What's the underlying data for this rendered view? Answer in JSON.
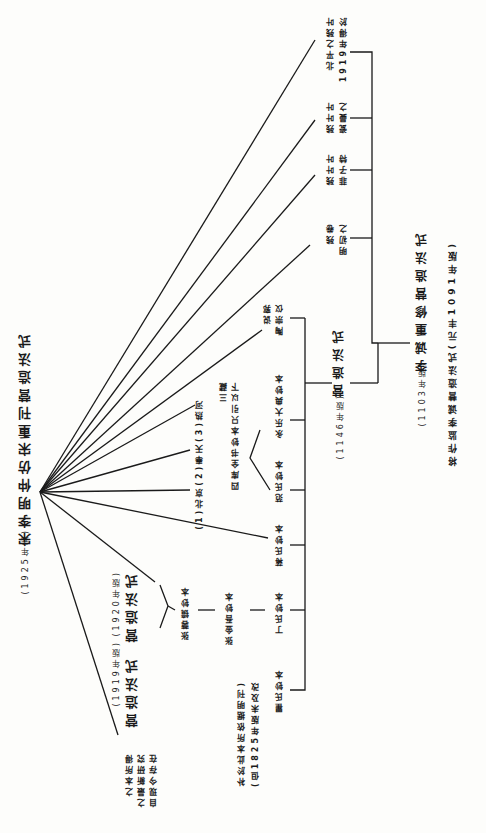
{
  "diagram": {
    "orientation": "rotated 90deg clockwise, text reads top-to-bottom in columns",
    "root": {
      "title": "宋李明仲营造法式",
      "sub": "(1001年)",
      "label_full": "将作监李诚营造法式(元丰1091年版)"
    },
    "nodes": {
      "n1103": {
        "title": "李诚重修营造法式",
        "year": "(1103年版)"
      },
      "n1146": {
        "title": "营造法式",
        "year": "(1146年版)"
      },
      "n1919_beiping": {
        "line1": "1919年得於",
        "line2": "北平之残叶"
      },
      "n_lou": {
        "line1": "瓷曼之",
        "line2": "残叶叶"
      },
      "n_fei": {
        "line1": "菲子特",
        "line2": "残叶叶"
      },
      "n_yi": {
        "line1": "明初之",
        "line2": "残卷"
      },
      "n_tao": {
        "line1": "陶宗仪",
        "line2": "说郛"
      },
      "n_yongle": {
        "title": "永乐大典钞本"
      },
      "n_fan": {
        "title": "范氏钞本"
      },
      "n_sikuquan": {
        "line1": "四库全书钞本只引以下",
        "line2": "三藏"
      },
      "n_three": {
        "text": "(1)北京(2)奉天(3)热河"
      },
      "n_jiang": {
        "title": "蒋氏钞本"
      },
      "n_ding": {
        "title": "丁氏钞本"
      },
      "n_qu": {
        "title": "瞿氏钞本"
      },
      "n_qu_note": {
        "line1": "(但1825年版未及改",
        "line2": "补於此本所依据明刊)"
      },
      "n_tian": {
        "title": "张金吾钞本"
      },
      "n_zhang": {
        "title": "张蓉镜钞本"
      },
      "n_1920": {
        "title": "营造法式",
        "year": "(1920年版)"
      },
      "n_1919": {
        "title": "营造法式",
        "year": "(1919年版)"
      },
      "n_self": {
        "line1": "自现今存在",
        "line2": "之最新研究",
        "line3": "之本所得"
      },
      "final": {
        "title": "宋李明仲营造法式重刊",
        "year": "(1925年元)"
      }
    },
    "final_title_full": "宋李明仲仿宋重刊营造法式",
    "final_year": "(1925年元)"
  },
  "labels": {
    "top_right_1": "将作监李诚营造法式(元丰1091年版)",
    "top_right_2": "李诚重修营造法式",
    "top_right_2_year": "(1103年版)",
    "center_title": "营造法式",
    "center_year": "(1146年版)",
    "leaf_1a": "1919年得於",
    "leaf_1b": "北平之残叶",
    "leaf_2a": "瓷曼之",
    "leaf_2b": "残叶叶",
    "leaf_3a": "菲子特",
    "leaf_3b": "残叶叶",
    "leaf_4a": "明初之",
    "leaf_4b": "残卷",
    "tao_a": "陶宗仪",
    "tao_b": "说郛",
    "yongle": "永乐大典钞本",
    "fan": "范氏钞本",
    "siku_a": "四库全书钞本只引以下",
    "siku_b": "三藏",
    "three": "(1)北京(2)奉天(3)热河",
    "jiang": "蒋氏钞本",
    "ding": "丁氏钞本",
    "qu": "瞿氏钞本",
    "qu_note_a": "(但1825年版未及改",
    "qu_note_b": "补於此本所依据明刊)",
    "zhangjinwu": "张金吾钞本",
    "zhangrongjing": "张蓉镜钞本",
    "ed1920": "营造法式",
    "ed1920_year": "(1920年版)",
    "ed1919": "营造法式",
    "ed1919_year": "(1919年版)",
    "self_a": "自现今存在",
    "self_b": "之最新研究",
    "self_c": "之本所得",
    "final_title": "宋李明仲仿宋重刊营造法式",
    "final_year": "(1925年元)"
  }
}
